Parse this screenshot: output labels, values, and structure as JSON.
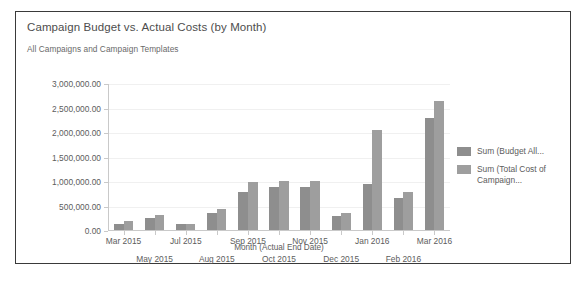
{
  "chart_data": {
    "type": "bar",
    "title": "Campaign Budget vs. Actual Costs (by Month)",
    "subtitle": "All Campaigns and Campaign Templates",
    "xlabel": "Month (Actual End Date)",
    "ylabel": "",
    "ylim": [
      0,
      3000000
    ],
    "ytick_values": [
      0,
      500000,
      1000000,
      1500000,
      2000000,
      2500000,
      3000000
    ],
    "ytick_labels": [
      "0.00",
      "500,000.00",
      "1,000,000.00",
      "1,500,000.00",
      "2,000,000.00",
      "2,500,000.00",
      "3,000,000.00"
    ],
    "grid": true,
    "legend_position": "right",
    "categories": [
      "Mar 2015",
      "May 2015",
      "Jul 2015",
      "Aug 2015",
      "Sep 2015",
      "Oct 2015",
      "Nov 2015",
      "Dec 2015",
      "Jan 2016",
      "Feb 2016",
      "Mar 2016"
    ],
    "series": [
      {
        "name": "Sum (Budget All...",
        "color": "#8e8e8e",
        "values": [
          150000,
          270000,
          150000,
          370000,
          800000,
          900000,
          900000,
          300000,
          950000,
          670000,
          2300000
        ]
      },
      {
        "name": "Sum (Total Cost of Campaign...",
        "color": "#9e9e9e",
        "values": [
          200000,
          320000,
          150000,
          440000,
          1000000,
          1030000,
          1030000,
          370000,
          2060000,
          800000,
          2660000
        ]
      }
    ]
  },
  "legend": {
    "items": [
      {
        "label": "Sum (Budget All...",
        "color": "#8e8e8e"
      },
      {
        "label": "Sum (Total Cost of Campaign...",
        "color": "#9e9e9e"
      }
    ]
  },
  "colors": {
    "panel_border": "#3a3a3a",
    "axis": "#c9c9c9",
    "gridline": "#f0f0f0",
    "text": "#5c5c5c",
    "title_text": "#4d4d4d"
  }
}
